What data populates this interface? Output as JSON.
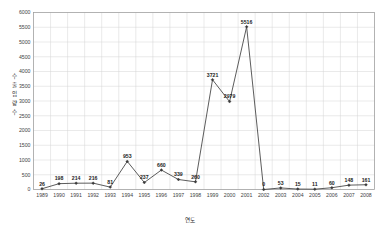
{
  "chart_data": {
    "type": "line",
    "title": "",
    "xlabel": "연도",
    "ylabel": "수 출 입 량 수",
    "ylim": [
      0,
      6000
    ],
    "ytick_step": 500,
    "yticks": [
      0,
      500,
      1000,
      1500,
      2000,
      2500,
      3000,
      3500,
      4000,
      4500,
      5000,
      5500,
      6000
    ],
    "grid": true,
    "legend": "none",
    "marker": "diamond",
    "line_color": "#4a4a4a",
    "marker_color": "#3a3a3a",
    "grid_color": "#d4d4d4",
    "border_color": "#9a9a9a",
    "categories": [
      "1989",
      "1990",
      "1991",
      "1992",
      "1993",
      "1994",
      "1995",
      "1996",
      "1997",
      "1998",
      "1999",
      "2000",
      "2001",
      "2002",
      "2003",
      "2004",
      "2005",
      "2006",
      "2007",
      "2008"
    ],
    "values": [
      26,
      198,
      214,
      216,
      81,
      953,
      237,
      660,
      339,
      260,
      3721,
      2979,
      5516,
      0,
      53,
      15,
      11,
      60,
      148,
      161
    ],
    "data_labels": [
      "26",
      "198",
      "214",
      "216",
      "81",
      "953",
      "237",
      "660",
      "339",
      "260",
      "3721",
      "2979",
      "5516",
      "0",
      "53",
      "15",
      "11",
      "60",
      "148",
      "161"
    ]
  }
}
